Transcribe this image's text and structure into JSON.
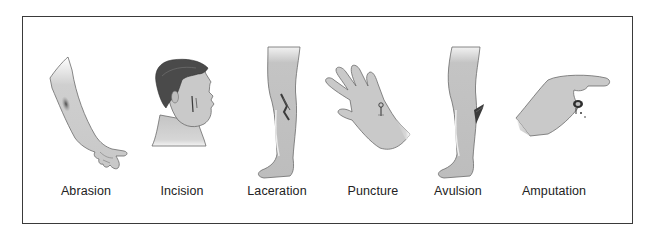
{
  "figure": {
    "panels": [
      {
        "id": "abrasion",
        "label": "Abrasion",
        "depicts": "forearm and hand with scraped skin"
      },
      {
        "id": "incision",
        "label": "Incision",
        "depicts": "head in profile with clean cut on cheek"
      },
      {
        "id": "laceration",
        "label": "Laceration",
        "depicts": "lower leg with jagged tear on shin"
      },
      {
        "id": "puncture",
        "label": "Puncture",
        "depicts": "open palm with nail piercing the skin"
      },
      {
        "id": "avulsion",
        "label": "Avulsion",
        "depicts": "lower leg with flap of skin torn away"
      },
      {
        "id": "amputation",
        "label": "Amputation",
        "depicts": "hand with severed fingertip, bleeding"
      }
    ]
  },
  "colors": {
    "border": "#3a3a3a",
    "skin": "#c9c9c9",
    "skin_light": "#e2e2e2",
    "outline": "#6b6b6b",
    "hair": "#4a4a4a",
    "wound": "#3b3b3b",
    "text": "#222222"
  }
}
